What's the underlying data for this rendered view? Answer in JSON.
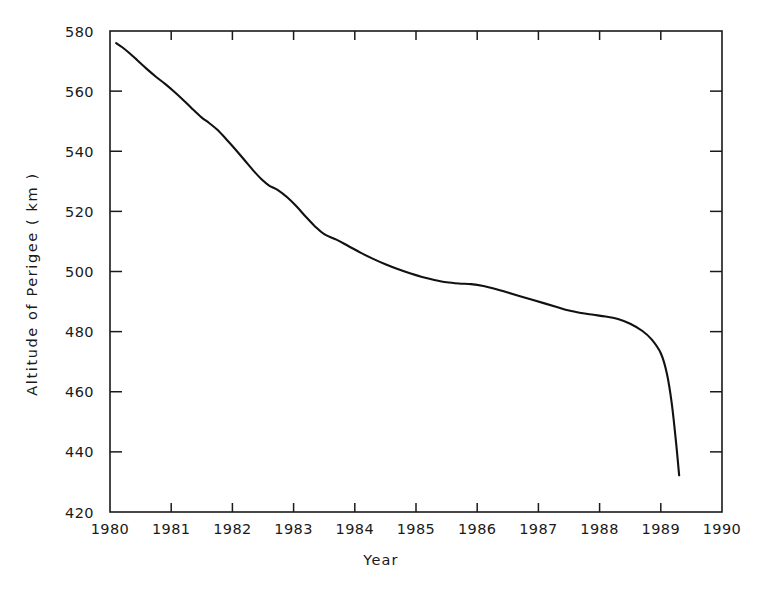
{
  "chart_data": {
    "type": "line",
    "title": "",
    "xlabel": "Year",
    "ylabel": "Altitude of Perigee ( km )",
    "xlim": [
      1980,
      1990
    ],
    "ylim": [
      420,
      580
    ],
    "grid": false,
    "legend": "none",
    "xticks": [
      1980,
      1981,
      1982,
      1983,
      1984,
      1985,
      1986,
      1987,
      1988,
      1989,
      1990
    ],
    "xticklabels": [
      "1980",
      "1981",
      "1982",
      "1983",
      "1984",
      "1985",
      "1986",
      "1987",
      "1988",
      "1989",
      "1990"
    ],
    "yticks": [
      420,
      440,
      460,
      480,
      500,
      520,
      540,
      560,
      580
    ],
    "yticklabels": [
      "420",
      "440",
      "460",
      "480",
      "500",
      "520",
      "540",
      "560",
      "580"
    ],
    "line_color": "#111111",
    "line_width": 2.1,
    "series": [
      {
        "name": "Altitude of Perigee",
        "x": [
          1980.1,
          1980.2,
          1980.32,
          1980.45,
          1980.6,
          1980.75,
          1980.9,
          1981.05,
          1981.2,
          1981.35,
          1981.5,
          1981.62,
          1981.75,
          1981.9,
          1982.05,
          1982.2,
          1982.35,
          1982.48,
          1982.6,
          1982.75,
          1982.9,
          1983.05,
          1983.2,
          1983.35,
          1983.5,
          1983.7,
          1983.9,
          1984.1,
          1984.3,
          1984.5,
          1984.7,
          1984.9,
          1985.1,
          1985.3,
          1985.5,
          1985.7,
          1985.9,
          1986.1,
          1986.3,
          1986.5,
          1986.7,
          1986.9,
          1987.1,
          1987.3,
          1987.5,
          1987.7,
          1987.9,
          1988.1,
          1988.3,
          1988.5,
          1988.7,
          1988.85,
          1989.0,
          1989.1,
          1989.18,
          1989.25,
          1989.3
        ],
        "y": [
          576.0,
          574.6,
          572.6,
          570.2,
          567.4,
          564.8,
          562.4,
          559.8,
          557.0,
          554.0,
          551.2,
          549.4,
          547.2,
          544.0,
          540.6,
          537.0,
          533.4,
          530.6,
          528.6,
          527.0,
          524.6,
          521.6,
          518.2,
          515.0,
          512.4,
          510.6,
          508.4,
          506.2,
          504.2,
          502.4,
          500.8,
          499.4,
          498.2,
          497.2,
          496.4,
          496.0,
          495.8,
          495.2,
          494.2,
          493.0,
          491.8,
          490.6,
          489.4,
          488.2,
          487.0,
          486.2,
          485.6,
          485.0,
          484.2,
          482.6,
          480.2,
          477.4,
          472.8,
          466.0,
          456.0,
          443.0,
          432.2
        ]
      }
    ]
  },
  "axes": {
    "frame_color": "#1a1a1a",
    "tick_marks": "inward",
    "top_ticks_visible": true,
    "right_ticks_visible": true
  }
}
